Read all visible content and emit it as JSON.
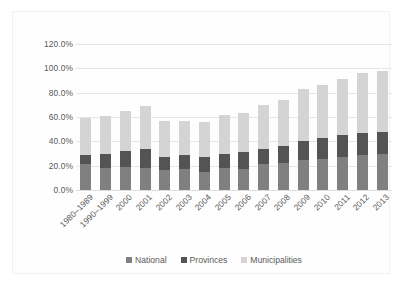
{
  "chart_data": {
    "type": "bar",
    "subtype": "stacked-column",
    "title": "",
    "subtitle": "",
    "xlabel": "",
    "ylabel": "",
    "categories": [
      "1980–1989",
      "1990–1999",
      "2000",
      "2001",
      "2002",
      "2003",
      "2004",
      "2005",
      "2006",
      "2007",
      "2008",
      "2009",
      "2010",
      "2011",
      "2012",
      "2013"
    ],
    "series": [
      {
        "name": "National",
        "color": "#808080",
        "values": [
          21.0,
          18.5,
          19.0,
          18.5,
          16.5,
          17.5,
          15.0,
          18.0,
          17.5,
          21.0,
          22.5,
          25.0,
          25.5,
          27.0,
          29.0,
          29.5
        ]
      },
      {
        "name": "Provinces",
        "color": "#545454",
        "values": [
          8.0,
          11.5,
          13.0,
          15.0,
          10.5,
          11.0,
          12.0,
          12.0,
          14.0,
          13.0,
          13.5,
          15.5,
          17.0,
          18.0,
          17.5,
          18.0
        ]
      },
      {
        "name": "Municipalities",
        "color": "#d4d4d4",
        "values": [
          30.5,
          31.0,
          33.0,
          35.5,
          30.0,
          28.5,
          29.0,
          31.5,
          31.5,
          36.0,
          38.0,
          42.5,
          43.5,
          46.5,
          49.5,
          50.5
        ]
      }
    ],
    "totals": [
      59.5,
      61.0,
      65.0,
      69.0,
      57.0,
      57.0,
      56.0,
      61.5,
      63.0,
      70.0,
      74.0,
      83.0,
      86.0,
      91.5,
      96.0,
      98.0
    ],
    "y_ticks": [
      "0.0%",
      "20.0%",
      "40.0%",
      "60.0%",
      "80.0%",
      "100.0%",
      "120.0%"
    ],
    "y_tick_values": [
      0,
      20,
      40,
      60,
      80,
      100,
      120
    ],
    "ylim": [
      0,
      120
    ],
    "grid": true,
    "legend": {
      "position": "bottom",
      "entries": [
        {
          "label": "National",
          "color": "#808080"
        },
        {
          "label": "Provinces",
          "color": "#545454"
        },
        {
          "label": "Municipalities",
          "color": "#d4d4d4"
        }
      ]
    },
    "axis_label_rotation": -45,
    "value_unit": "percent"
  },
  "colors": {
    "background": "#ffffff",
    "plot_background": "#fefefe",
    "gridline": "#e6e6e6",
    "baseline": "#dddddd",
    "tick_text": "#595959",
    "frame_border": "#f2f2f2"
  }
}
